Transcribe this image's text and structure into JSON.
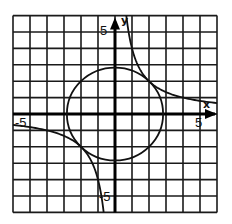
{
  "chart_data": {
    "type": "line",
    "title": "",
    "xlabel": "x",
    "ylabel": "y",
    "xlim": [
      -6,
      6
    ],
    "ylim": [
      -6,
      6
    ],
    "grid": true,
    "grid_step": 1,
    "tick_labels": {
      "x_neg": "-5",
      "x_pos": "5",
      "y_pos": "5",
      "y_neg": "-5"
    },
    "series": [
      {
        "name": "circle",
        "equation": "x^2 + y^2 = 8",
        "kind": "circle",
        "center": [
          0,
          0
        ],
        "radius": 2.83
      },
      {
        "name": "hyperbola",
        "equation": "xy = 4",
        "kind": "hyperbola",
        "k": 4
      }
    ],
    "tangent_points": [
      [
        2,
        2
      ],
      [
        -2,
        -2
      ]
    ]
  },
  "colors": {
    "grid": "#1a1a1a",
    "curve": "#111111",
    "background": "#ffffff"
  }
}
